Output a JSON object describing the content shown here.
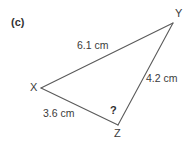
{
  "figure": {
    "part_label": "(c)",
    "background_color": "#ffffff",
    "stroke_color": "#5a5a5a",
    "text_color": "#3b3b3b",
    "width": 196,
    "height": 142
  },
  "vertices": [
    {
      "name": "X",
      "label": "X",
      "x": 41,
      "y": 88
    },
    {
      "name": "Y",
      "label": "Y",
      "x": 173,
      "y": 23
    },
    {
      "name": "Z",
      "label": "Z",
      "x": 118,
      "y": 125
    }
  ],
  "sides": [
    {
      "name": "XY",
      "label": "6.1 cm",
      "value": 6.1,
      "unit": "cm",
      "from": "X",
      "to": "Y"
    },
    {
      "name": "YZ",
      "label": "4.2 cm",
      "value": 4.2,
      "unit": "cm",
      "from": "Y",
      "to": "Z"
    },
    {
      "name": "XZ",
      "label": "3.6 cm",
      "value": 3.6,
      "unit": "cm",
      "from": "X",
      "to": "Z"
    }
  ],
  "angles": [
    {
      "name": "Z",
      "label": "?",
      "known": false
    }
  ]
}
